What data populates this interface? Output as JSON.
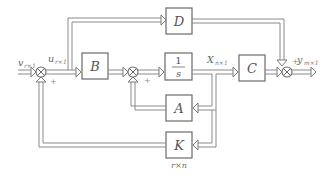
{
  "diagram": {
    "type": "state-space block diagram with state feedback",
    "blocks": {
      "B": {
        "label": "B"
      },
      "integrator": {
        "numerator": "1",
        "denominator": "s"
      },
      "C": {
        "label": "C"
      },
      "D": {
        "label": "D"
      },
      "A": {
        "label": "A"
      },
      "K": {
        "label": "K",
        "caption": "r×n"
      }
    },
    "signals": {
      "input": {
        "base": "v",
        "sub": "r×1"
      },
      "control": {
        "base": "u",
        "sub": "r×1"
      },
      "state": {
        "base": "X",
        "sub": "n×1"
      },
      "output": {
        "base": "y",
        "sub": "m×1"
      }
    },
    "summing_junctions": [
      {
        "id": "sum1",
        "signs": [
          "+"
        ]
      },
      {
        "id": "sum2",
        "signs": [
          "+"
        ]
      },
      {
        "id": "sum3",
        "signs": [
          "+"
        ]
      }
    ]
  }
}
